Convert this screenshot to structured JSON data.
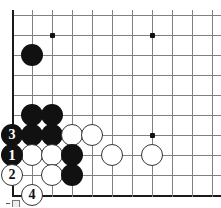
{
  "diagram": {
    "board": {
      "columns": 11,
      "rows": 10,
      "origin_x": 12,
      "origin_y": 15,
      "spacing": 20,
      "line_color": "#808080",
      "edge_color": "#1a1a1a",
      "background": "#ffffff"
    },
    "star_points": [
      {
        "name": "star-point-upper-left",
        "col": 2,
        "row": 1
      },
      {
        "name": "star-point-upper-right",
        "col": 7,
        "row": 1
      },
      {
        "name": "star-point-lower-right",
        "col": 7,
        "row": 6
      }
    ],
    "stones": [
      {
        "name": "black-stone-c1r2",
        "color": "black",
        "col": 1,
        "row": 2,
        "label": ""
      },
      {
        "name": "black-stone-c1r5",
        "color": "black",
        "col": 1,
        "row": 5,
        "label": ""
      },
      {
        "name": "black-stone-c2r5p",
        "color": "black",
        "col": 2,
        "row": 5,
        "label": ""
      },
      {
        "name": "black-stone-c1r6",
        "color": "black",
        "col": 1,
        "row": 6,
        "label": ""
      },
      {
        "name": "black-stone-c2r6",
        "color": "black",
        "col": 2,
        "row": 6,
        "label": ""
      },
      {
        "name": "white-stone-c3r6",
        "color": "white",
        "col": 3,
        "row": 6,
        "label": ""
      },
      {
        "name": "white-stone-c4r6",
        "color": "white",
        "col": 4,
        "row": 6,
        "label": ""
      },
      {
        "name": "white-stone-c1r7",
        "color": "white",
        "col": 1,
        "row": 7,
        "label": ""
      },
      {
        "name": "white-stone-c2r7",
        "color": "white",
        "col": 2,
        "row": 7,
        "label": ""
      },
      {
        "name": "black-stone-c3r7",
        "color": "black",
        "col": 3,
        "row": 7,
        "label": ""
      },
      {
        "name": "white-stone-c5r7",
        "color": "white",
        "col": 5,
        "row": 7,
        "label": ""
      },
      {
        "name": "white-stone-c7r7",
        "color": "white",
        "col": 7,
        "row": 7,
        "label": ""
      },
      {
        "name": "white-stone-c2r8",
        "color": "white",
        "col": 2,
        "row": 8,
        "label": ""
      },
      {
        "name": "black-stone-c3r8",
        "color": "black",
        "col": 3,
        "row": 8,
        "label": ""
      }
    ],
    "numbered_stones": [
      {
        "name": "move-stone-3",
        "color": "black",
        "col": 0,
        "row": 6,
        "label": "3"
      },
      {
        "name": "move-stone-1",
        "color": "black",
        "col": 0,
        "row": 7,
        "label": "1"
      },
      {
        "name": "move-stone-2",
        "color": "white",
        "col": 0,
        "row": 8,
        "label": "2"
      },
      {
        "name": "move-stone-4",
        "color": "white",
        "col": 1,
        "row": 9,
        "label": "4"
      }
    ]
  }
}
